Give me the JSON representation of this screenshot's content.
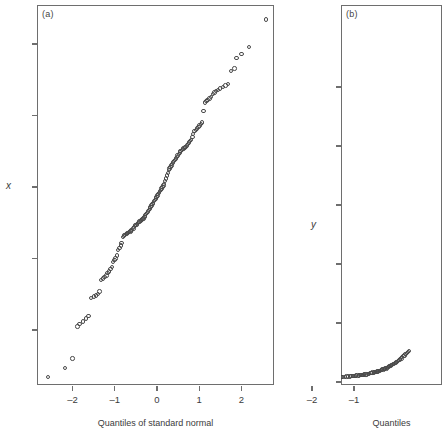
{
  "figure": {
    "background": "#ffffff",
    "marker_color": "#4a4a4a",
    "frame_color": "#6e6e6e"
  },
  "panel_a": {
    "tag": "(a)",
    "ylabel": "x",
    "xlabel": "Quantiles of standard normal",
    "y_ticks": [
      "2",
      "1",
      "0",
      "–1",
      "–2"
    ],
    "x_ticks": [
      "–2",
      "–1",
      "0",
      "1",
      "2"
    ]
  },
  "panel_b": {
    "tag": "(b)",
    "ylabel": "y",
    "xlabel": "Quantiles",
    "y_ticks": [
      "5",
      "4",
      "3",
      "2",
      "1",
      "0"
    ],
    "x_ticks": [
      "–2",
      "–1"
    ]
  },
  "chart_data": {
    "type": "scatter",
    "title": "",
    "subtitle": "",
    "panels": [
      {
        "id": "a",
        "tag": "(a)",
        "type": "scatter",
        "title": "",
        "xlabel": "Quantiles of standard normal",
        "ylabel": "x",
        "xlim": [
          -2.8,
          2.8
        ],
        "ylim": [
          -2.85,
          2.6
        ],
        "xticks": [
          -2,
          -1,
          0,
          1,
          2
        ],
        "yticks": [
          -2,
          -1,
          0,
          1,
          2
        ],
        "grid": false,
        "legend": "none",
        "marker": "open-circle",
        "description": "Normal quantile-quantile plot of variable x; points form a roughly straight increasing band with mild curvature at the tails.",
        "x": [
          -2.58,
          -2.18,
          -2.0,
          -1.88,
          -1.84,
          -1.76,
          -1.68,
          -1.62,
          -1.56,
          -1.5,
          -1.45,
          -1.4,
          -1.36,
          -1.32,
          -1.28,
          -1.24,
          -1.2,
          -1.17,
          -1.14,
          -1.1,
          -1.07,
          -1.04,
          -1.01,
          -0.98,
          -0.95,
          -0.92,
          -0.89,
          -0.86,
          -0.84,
          -0.81,
          -0.78,
          -0.76,
          -0.73,
          -0.71,
          -0.68,
          -0.66,
          -0.63,
          -0.61,
          -0.59,
          -0.56,
          -0.54,
          -0.52,
          -0.49,
          -0.47,
          -0.45,
          -0.43,
          -0.41,
          -0.38,
          -0.36,
          -0.34,
          -0.32,
          -0.3,
          -0.28,
          -0.26,
          -0.24,
          -0.21,
          -0.19,
          -0.17,
          -0.15,
          -0.13,
          -0.11,
          -0.09,
          -0.07,
          -0.05,
          -0.03,
          -0.01,
          0.01,
          0.03,
          0.05,
          0.07,
          0.09,
          0.11,
          0.13,
          0.15,
          0.17,
          0.19,
          0.21,
          0.24,
          0.26,
          0.28,
          0.3,
          0.32,
          0.34,
          0.36,
          0.38,
          0.41,
          0.43,
          0.45,
          0.47,
          0.49,
          0.52,
          0.54,
          0.56,
          0.59,
          0.61,
          0.63,
          0.66,
          0.68,
          0.71,
          0.73,
          0.76,
          0.78,
          0.81,
          0.84,
          0.86,
          0.89,
          0.92,
          0.95,
          0.98,
          1.01,
          1.04,
          1.07,
          1.1,
          1.14,
          1.17,
          1.2,
          1.24,
          1.28,
          1.32,
          1.36,
          1.4,
          1.45,
          1.5,
          1.56,
          1.62,
          1.68,
          1.76,
          1.84,
          1.88,
          2.0,
          2.18,
          2.58
        ],
        "y": [
          -2.66,
          -2.53,
          -2.4,
          -1.95,
          -1.92,
          -1.88,
          -1.84,
          -1.8,
          -1.55,
          -1.53,
          -1.52,
          -1.5,
          -1.46,
          -1.3,
          -1.28,
          -1.26,
          -1.24,
          -1.2,
          -1.18,
          -1.15,
          -1.12,
          -1.05,
          -1.02,
          -1.0,
          -0.96,
          -0.88,
          -0.85,
          -0.82,
          -0.78,
          -0.7,
          -0.68,
          -0.67,
          -0.66,
          -0.65,
          -0.64,
          -0.63,
          -0.62,
          -0.61,
          -0.6,
          -0.58,
          -0.56,
          -0.54,
          -0.53,
          -0.52,
          -0.5,
          -0.49,
          -0.48,
          -0.47,
          -0.46,
          -0.45,
          -0.44,
          -0.42,
          -0.4,
          -0.38,
          -0.36,
          -0.34,
          -0.32,
          -0.3,
          -0.28,
          -0.26,
          -0.24,
          -0.22,
          -0.2,
          -0.18,
          -0.16,
          -0.14,
          -0.12,
          -0.1,
          -0.08,
          -0.06,
          -0.04,
          -0.02,
          0.0,
          0.02,
          0.04,
          0.08,
          0.12,
          0.16,
          0.2,
          0.24,
          0.26,
          0.28,
          0.3,
          0.32,
          0.34,
          0.36,
          0.38,
          0.4,
          0.42,
          0.44,
          0.46,
          0.48,
          0.5,
          0.52,
          0.53,
          0.54,
          0.55,
          0.56,
          0.58,
          0.6,
          0.62,
          0.64,
          0.66,
          0.7,
          0.74,
          0.78,
          0.8,
          0.82,
          0.84,
          0.86,
          0.88,
          0.9,
          1.06,
          1.18,
          1.2,
          1.22,
          1.24,
          1.26,
          1.3,
          1.32,
          1.34,
          1.36,
          1.38,
          1.4,
          1.42,
          1.44,
          1.62,
          1.66,
          1.8,
          1.86,
          1.96,
          2.34
        ]
      },
      {
        "id": "b",
        "tag": "(b)",
        "type": "scatter",
        "title": "",
        "xlabel": "Quantiles",
        "ylabel": "y",
        "xlim": [
          -2.8,
          0.35
        ],
        "ylim": [
          -0.15,
          5.9
        ],
        "xticks": [
          -2,
          -1
        ],
        "yticks": [
          0,
          1,
          2,
          3,
          4,
          5
        ],
        "grid": false,
        "legend": "none",
        "marker": "open-circle",
        "description": "Quantile plot of variable y; nearly all points lie close to zero with a slow rise toward the right, indicating strong right skew.",
        "x": [
          -2.58,
          -2.18,
          -2.0,
          -1.88,
          -1.8,
          -1.72,
          -1.64,
          -1.58,
          -1.52,
          -1.46,
          -1.41,
          -1.36,
          -1.31,
          -1.27,
          -1.22,
          -1.18,
          -1.14,
          -1.1,
          -1.06,
          -1.02,
          -0.99,
          -0.95,
          -0.92,
          -0.88,
          -0.85,
          -0.82,
          -0.79,
          -0.76,
          -0.73,
          -0.7,
          -0.67,
          -0.64,
          -0.61,
          -0.58,
          -0.56,
          -0.53,
          -0.5,
          -0.48,
          -0.45,
          -0.43,
          -0.4,
          -0.38,
          -0.35,
          -0.33,
          -0.3,
          -0.28,
          -0.26,
          -0.23,
          -0.21,
          -0.19,
          -0.16,
          -0.14,
          -0.12,
          -0.09,
          -0.07,
          -0.05,
          -0.02,
          0.0,
          0.03,
          0.05,
          0.08,
          0.1,
          0.13,
          0.15,
          0.18,
          0.2,
          0.23,
          0.26,
          0.28,
          0.31
        ],
        "y": [
          0.01,
          0.01,
          0.01,
          0.02,
          0.03,
          0.04,
          0.05,
          0.05,
          0.06,
          0.06,
          0.07,
          0.07,
          0.08,
          0.08,
          0.08,
          0.09,
          0.09,
          0.09,
          0.1,
          0.1,
          0.1,
          0.11,
          0.11,
          0.11,
          0.12,
          0.12,
          0.12,
          0.13,
          0.13,
          0.13,
          0.14,
          0.14,
          0.15,
          0.15,
          0.16,
          0.16,
          0.17,
          0.17,
          0.18,
          0.18,
          0.19,
          0.19,
          0.2,
          0.21,
          0.21,
          0.22,
          0.23,
          0.23,
          0.24,
          0.25,
          0.26,
          0.27,
          0.28,
          0.29,
          0.3,
          0.31,
          0.32,
          0.33,
          0.34,
          0.36,
          0.37,
          0.39,
          0.4,
          0.42,
          0.44,
          0.45,
          0.47,
          0.49,
          0.51,
          0.53
        ]
      }
    ]
  }
}
